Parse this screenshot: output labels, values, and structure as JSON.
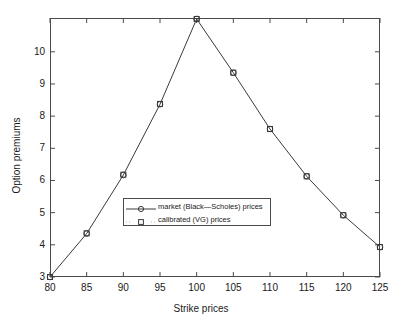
{
  "chart_data": {
    "type": "line",
    "title": "",
    "xlabel": "Strike prices",
    "ylabel": "Option premiums",
    "x": [
      80,
      85,
      90,
      95,
      100,
      105,
      110,
      115,
      120,
      125
    ],
    "xlim": [
      80,
      125
    ],
    "ylim": [
      3,
      11.05
    ],
    "xticks": [
      80,
      85,
      90,
      95,
      100,
      105,
      110,
      115,
      120,
      125
    ],
    "xtick_labels": [
      "80",
      "85",
      "90",
      "95",
      "100",
      "105",
      "110",
      "115",
      "120",
      "125"
    ],
    "yticks": [
      3,
      4,
      5,
      6,
      7,
      8,
      9,
      10
    ],
    "ytick_labels": [
      "3",
      "4",
      "5",
      "6",
      "7",
      "8",
      "9",
      "10"
    ],
    "grid": false,
    "legend_position": "center",
    "series": [
      {
        "name": "market (Black—Scholes) prices",
        "marker": "circle",
        "line": "solid",
        "color": "#3a3a3a",
        "values": [
          3.0,
          4.35,
          6.17,
          8.37,
          11.02,
          9.35,
          7.6,
          6.13,
          4.92,
          3.93
        ]
      },
      {
        "name": "calibrated (VG) prices",
        "marker": "square",
        "line": "none",
        "color": "#3a3a3a",
        "values": [
          3.0,
          4.36,
          6.18,
          8.38,
          11.02,
          9.35,
          7.6,
          6.13,
          4.92,
          3.93
        ]
      }
    ]
  },
  "legend": {
    "items": [
      {
        "label": "market (Black—Scholes) prices",
        "marker": "circle"
      },
      {
        "label": "calibrated (VG) prices",
        "marker": "square"
      }
    ]
  },
  "axes": {
    "x_title": "Strike prices",
    "y_title": "Option premiums"
  }
}
